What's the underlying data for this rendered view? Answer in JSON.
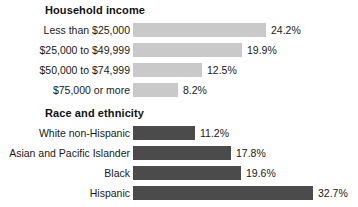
{
  "chart_data": {
    "type": "bar",
    "orientation": "horizontal",
    "title": "",
    "xlabel": "",
    "ylabel": "",
    "grid": false,
    "legend": false,
    "value_suffix": "%",
    "xlim": [
      0,
      35
    ],
    "px_per_unit": 5.5,
    "panels": [
      {
        "id": "household-income",
        "title": "Household income",
        "bar_color": "#c9c9c9",
        "bar_style": "light",
        "categories": [
          "Less than $25,000",
          "$25,000 to $49,999",
          "$50,000 to $74,999",
          "$75,000 or more"
        ],
        "values": [
          24.2,
          19.9,
          12.5,
          8.2
        ],
        "value_labels": [
          "24.2%",
          "19.9%",
          "12.5%",
          "8.2%"
        ]
      },
      {
        "id": "race-and-ethnicity",
        "title": "Race and ethnicity",
        "bar_color": "#4b4b4b",
        "bar_style": "dark",
        "categories": [
          "White non-Hispanic",
          "Asian and Pacific Islander",
          "Black",
          "Hispanic"
        ],
        "values": [
          11.2,
          17.8,
          19.6,
          32.7
        ],
        "value_labels": [
          "11.2%",
          "17.8%",
          "19.6%",
          "32.7%"
        ]
      }
    ]
  }
}
